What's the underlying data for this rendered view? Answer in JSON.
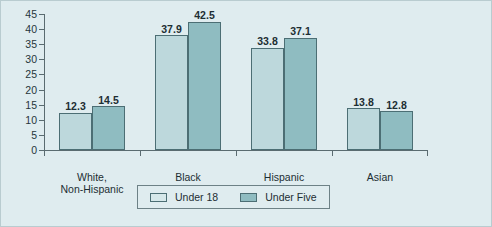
{
  "chart_data": {
    "type": "bar",
    "title": "",
    "subtitle": "",
    "xlabel": "",
    "ylabel": "",
    "categories": [
      "White, Non-Hispanic",
      "Black",
      "Hispanic",
      "Asian"
    ],
    "category_lines": [
      [
        "White,",
        "Non-Hispanic"
      ],
      [
        "Black"
      ],
      [
        "Hispanic"
      ],
      [
        "Asian"
      ]
    ],
    "series": [
      {
        "name": "Under 18",
        "color": "#bdd8dc",
        "values": [
          12.3,
          37.9,
          33.8,
          13.8
        ]
      },
      {
        "name": "Under Five",
        "color": "#8fbcc1",
        "values": [
          14.5,
          42.5,
          37.1,
          12.8
        ]
      }
    ],
    "value_labels": [
      [
        "12.3",
        "14.5"
      ],
      [
        "37.9",
        "42.5"
      ],
      [
        "33.8",
        "37.1"
      ],
      [
        "13.8",
        "12.8"
      ]
    ],
    "ylim": [
      0,
      45
    ],
    "ytick_step": 5,
    "yticks": [
      "0",
      "5",
      "10",
      "15",
      "20",
      "25",
      "30",
      "35",
      "40",
      "45"
    ],
    "grid": false,
    "legend_position": "bottom-center",
    "legend": [
      "Under 18",
      "Under Five"
    ],
    "background_color": "#dfecef",
    "axis_color": "#5a6b70",
    "bar_border_color": "#4c6e74"
  }
}
